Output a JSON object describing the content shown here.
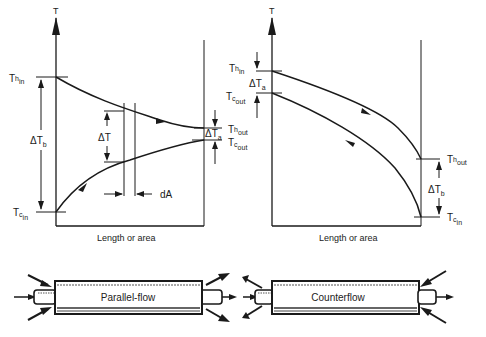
{
  "parallel": {
    "axis_label": "T",
    "x_label": "Length or area",
    "th_in": {
      "base": "T",
      "sub": "h",
      "subsub": "in"
    },
    "tc_in": {
      "base": "T",
      "sub": "c",
      "subsub": "in"
    },
    "th_out": {
      "base": "T",
      "sub": "h",
      "subsub": "out"
    },
    "tc_out": {
      "base": "T",
      "sub": "c",
      "subsub": "out"
    },
    "delta_b": {
      "base": "ΔT",
      "sub": "b"
    },
    "delta_a": {
      "base": "ΔT",
      "sub": "a"
    },
    "delta_t": "ΔT",
    "dA": "dA",
    "tube_label": "Parallel-flow"
  },
  "counter": {
    "axis_label": "T",
    "x_label": "Length or area",
    "th_in": {
      "base": "T",
      "sub": "h",
      "subsub": "in"
    },
    "tc_out": {
      "base": "T",
      "sub": "c",
      "subsub": "out"
    },
    "th_out": {
      "base": "T",
      "sub": "h",
      "subsub": "out"
    },
    "tc_in": {
      "base": "T",
      "sub": "c",
      "subsub": "in"
    },
    "delta_a": {
      "base": "ΔT",
      "sub": "a"
    },
    "delta_b": {
      "base": "ΔT",
      "sub": "b"
    },
    "tube_label": "Counterflow"
  },
  "colors": {
    "ink": "#1a1a1a",
    "paper": "#ffffff",
    "tube_shade": "#555555"
  }
}
